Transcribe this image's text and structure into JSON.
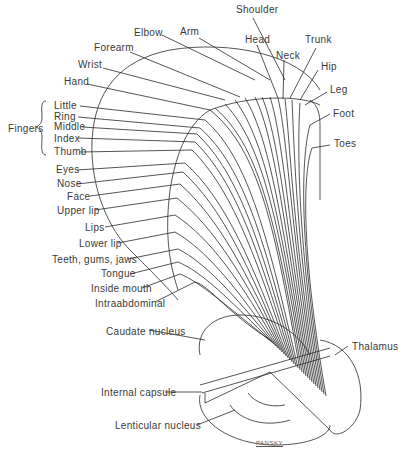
{
  "diagram": {
    "type": "motor homunculus — projection fibers from motor cortex through internal capsule",
    "top_labels": [
      {
        "id": "shoulder",
        "text": "Shoulder"
      },
      {
        "id": "arm",
        "text": "Arm"
      },
      {
        "id": "elbow",
        "text": "Elbow"
      },
      {
        "id": "head",
        "text": "Head"
      },
      {
        "id": "trunk",
        "text": "Trunk"
      },
      {
        "id": "neck",
        "text": "Neck"
      },
      {
        "id": "hip",
        "text": "Hip"
      },
      {
        "id": "forearm",
        "text": "Forearm"
      },
      {
        "id": "leg",
        "text": "Leg"
      },
      {
        "id": "wrist",
        "text": "Wrist"
      },
      {
        "id": "foot",
        "text": "Foot"
      },
      {
        "id": "hand",
        "text": "Hand"
      },
      {
        "id": "toes",
        "text": "Toes"
      }
    ],
    "fingers_group": {
      "label": "Fingers",
      "items": [
        "Little",
        "Ring",
        "Middle",
        "Index",
        "Thumb"
      ]
    },
    "face_labels": [
      "Eyes",
      "Nose",
      "Face",
      "Upper lip",
      "Lips",
      "Lower lip",
      "Teeth, gums, jaws",
      "Tongue",
      "Inside mouth",
      "Intraabdominal"
    ],
    "structures": {
      "caudate": "Caudate nucleus",
      "thalamus": "Thalamus",
      "internal_capsule": "Internal capsule",
      "lenticular": "Lenticular nucleus"
    },
    "signature": "PANSKY"
  }
}
